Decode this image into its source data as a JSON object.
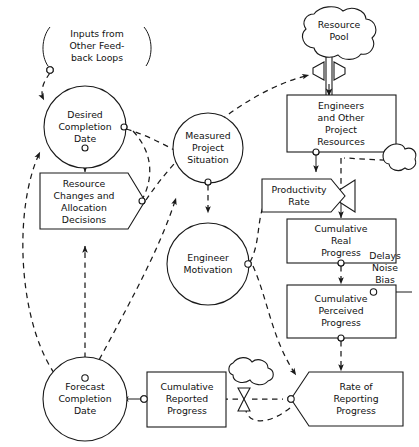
{
  "diagram": {
    "type": "stock-and-flow",
    "canvas": {
      "width": 419,
      "height": 447
    },
    "nodes": {
      "inputs_feedback": {
        "label_lines": [
          "Inputs from",
          "Other Feed-",
          "back Loops"
        ],
        "shape": "bracketed-annotation"
      },
      "desired_completion_date": {
        "label_lines": [
          "Desired",
          "Completion",
          "Date"
        ],
        "shape": "circle"
      },
      "resource_changes": {
        "label_lines": [
          "Resource",
          "Changes and",
          "Allocation",
          "Decisions"
        ],
        "shape": "rate-pentagon-right"
      },
      "measured_project_situation": {
        "label_lines": [
          "Measured",
          "Project",
          "Situation"
        ],
        "shape": "circle"
      },
      "engineer_motivation": {
        "label_lines": [
          "Engineer",
          "Motivation"
        ],
        "shape": "circle"
      },
      "forecast_completion_date": {
        "label_lines": [
          "Forecast",
          "Completion",
          "Date"
        ],
        "shape": "circle"
      },
      "cumulative_reported_progress": {
        "label_lines": [
          "Cumulative",
          "Reported",
          "Progress"
        ],
        "shape": "rectangle"
      },
      "resource_pool": {
        "label_lines": [
          "Resource",
          "Pool"
        ],
        "shape": "cloud"
      },
      "engineers_resources": {
        "label_lines": [
          "Engineers",
          "and Other",
          "Project",
          "Resources"
        ],
        "shape": "rectangle"
      },
      "productivity_rate": {
        "label_lines": [
          "Productivity",
          "Rate"
        ],
        "shape": "rate-pentagon-right"
      },
      "cumulative_real_progress": {
        "label_lines": [
          "Cumulative",
          "Real",
          "Progress"
        ],
        "shape": "rectangle"
      },
      "cumulative_perceived_progress": {
        "label_lines": [
          "Cumulative",
          "Perceived",
          "Progress"
        ],
        "shape": "rectangle"
      },
      "delays_noise_bias": {
        "label_lines": [
          "Delays",
          "Noise",
          "Bias"
        ],
        "shape": "annotation"
      },
      "rate_of_reporting_progress": {
        "label_lines": [
          "Rate of",
          "Reporting",
          "Progress"
        ],
        "shape": "rate-pentagon-left"
      },
      "sink_cloud_right": {
        "label_lines": [],
        "shape": "cloud-small"
      },
      "sink_cloud_bottom": {
        "label_lines": [],
        "shape": "cloud-small"
      }
    },
    "colors": {
      "stroke": "#1a1a1a",
      "background": "#ffffff",
      "text": "#111111"
    }
  }
}
